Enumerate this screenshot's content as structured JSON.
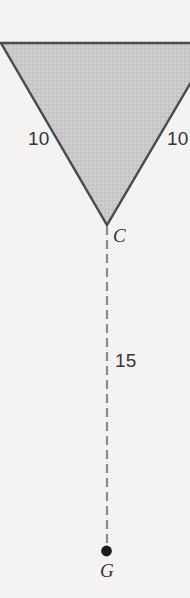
{
  "figure": {
    "background_color": "#f4f3f1",
    "shape": {
      "name": "inverted-triangle",
      "fill_color": "#c9c9c9",
      "stroke_color": "#4a4a4f",
      "apex_label": "C"
    },
    "labels": {
      "side_left": "10",
      "side_right": "10",
      "drop_length": "15",
      "vertex_apex": "C",
      "vertex_bottom": "G"
    },
    "dashed_line": {
      "name": "drop-line",
      "color": "#8a8a8f",
      "length_label": "15"
    },
    "point_g": {
      "name": "point-g",
      "color": "#1c1c1c",
      "label": "G"
    }
  }
}
